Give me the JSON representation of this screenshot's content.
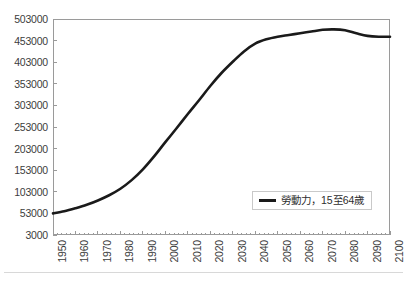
{
  "chart_data": {
    "type": "line",
    "title": "",
    "subtitle": "",
    "xlabel": "",
    "ylabel": "",
    "xlim": [
      1950,
      2100
    ],
    "ylim": [
      3000,
      503000
    ],
    "grid": false,
    "legend_position": "inside-lower-right",
    "y_ticks": [
      3000,
      53000,
      103000,
      153000,
      203000,
      253000,
      303000,
      353000,
      403000,
      453000,
      503000
    ],
    "x_ticks": [
      1950,
      1960,
      1970,
      1980,
      1990,
      2000,
      2010,
      2020,
      2030,
      2040,
      2050,
      2060,
      2070,
      2080,
      2090,
      2100
    ],
    "x_minor_tick_step": 2,
    "series": [
      {
        "name": "勞動力，15至64歲",
        "color": "#1a1a1a",
        "line_width": 2.6,
        "x": [
          1950,
          1955,
          1960,
          1965,
          1970,
          1975,
          1980,
          1985,
          1990,
          1995,
          2000,
          2005,
          2010,
          2015,
          2020,
          2025,
          2030,
          2035,
          2040,
          2045,
          2050,
          2055,
          2060,
          2065,
          2070,
          2075,
          2080,
          2085,
          2090,
          2095,
          2100
        ],
        "values": [
          53000,
          58000,
          65000,
          73000,
          83000,
          95000,
          110000,
          130000,
          155000,
          185000,
          218000,
          250000,
          283000,
          315000,
          348000,
          378000,
          404000,
          428000,
          446000,
          456000,
          462000,
          466000,
          470000,
          474000,
          478000,
          479000,
          477000,
          470000,
          464000,
          462000,
          462000
        ]
      }
    ]
  },
  "legend": {
    "entries": [
      {
        "label": "勞動力，15至64歲",
        "color": "#1a1a1a"
      }
    ]
  },
  "axes": {
    "y_tick_labels": [
      "503000",
      "453000",
      "403000",
      "353000",
      "303000",
      "253000",
      "203000",
      "153000",
      "103000",
      "53000",
      "3000"
    ],
    "x_tick_labels": [
      "1950",
      "1960",
      "1970",
      "1980",
      "1990",
      "2000",
      "2010",
      "2020",
      "2030",
      "2040",
      "2050",
      "2060",
      "2070",
      "2080",
      "2090",
      "2100"
    ]
  },
  "colors": {
    "line": "#1a1a1a",
    "frame": "#9a9a9a",
    "text": "#3c3c3c",
    "legend_border": "#c9c9c9",
    "background": "#ffffff"
  }
}
